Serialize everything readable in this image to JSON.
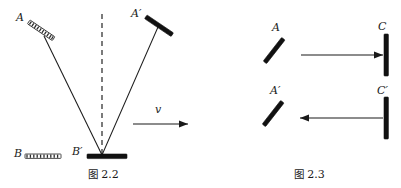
{
  "page": {
    "background_color": "#ffffff",
    "ink_color": "#1a1a1a",
    "width": 401,
    "height": 188
  },
  "figures": [
    {
      "id": "fig-2-2",
      "caption_prefix": "图",
      "caption_number": "2.2",
      "caption": "图 2.2",
      "description": "Light clock with tilted mirror A and horizontal mirror B at rest (dotted outlines), and primed positions A' and B' after moving with velocity v; light path forms a V from A' down to B' and back up.",
      "labels": [
        {
          "name": "A",
          "text": "A",
          "x": 16,
          "y": 21
        },
        {
          "name": "A-prime",
          "text": "A′",
          "x": 131,
          "y": 17
        },
        {
          "name": "B",
          "text": "B",
          "x": 14,
          "y": 157
        },
        {
          "name": "B-prime",
          "text": "B′",
          "x": 72,
          "y": 155
        },
        {
          "name": "v",
          "text": "v",
          "x": 155,
          "y": 113
        }
      ],
      "elements": {
        "mirror_A_dotted": "tilted dotted mirror at rest position A",
        "mirror_A_prime_solid": "tilted solid mirror at moved position A'",
        "mirror_B_dotted": "horizontal dotted mirror at rest position B",
        "mirror_B_prime_solid": "horizontal solid mirror at moved position B'",
        "dashed_vertical_line": "dashed vertical reference line through B'",
        "ray_down": "ray from A down-right to B'",
        "ray_up": "ray from B' up-right to A'",
        "velocity_arrow": "horizontal arrow labelled v pointing right"
      }
    },
    {
      "id": "fig-2-3",
      "caption_prefix": "图",
      "caption_number": "2.3",
      "caption": "图 2.3",
      "description": "Two rows: top row light travels from tilted mirror A rightward to vertical mirror C; bottom row light travels from vertical mirror C' leftward to tilted mirror A'.",
      "rows": [
        {
          "name": "top-row",
          "left_label": "A",
          "right_label": "C",
          "arrow_direction": "right"
        },
        {
          "name": "bottom-row",
          "left_label": "A′",
          "right_label": "C′",
          "arrow_direction": "left"
        }
      ],
      "labels": [
        {
          "name": "A",
          "text": "A",
          "x": 72,
          "y": 31
        },
        {
          "name": "C",
          "text": "C",
          "x": 178,
          "y": 30
        },
        {
          "name": "A-prime",
          "text": "A′",
          "x": 70,
          "y": 94
        },
        {
          "name": "C-prime",
          "text": "C′",
          "x": 177,
          "y": 94
        }
      ]
    }
  ]
}
